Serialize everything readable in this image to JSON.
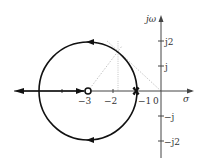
{
  "diagram": {
    "axes": {
      "imag_label": "jω",
      "real_label": "σ",
      "real_ticks": [
        "−3",
        "−2",
        "−1",
        "0"
      ],
      "imag_ticks": [
        "j2",
        "j",
        "−j",
        "−j2"
      ]
    },
    "markers": {
      "zero_label": "zero at −3",
      "pole_label": "double pole at −1"
    },
    "colors": {
      "locus": "#111111",
      "axis": "#444444",
      "guide": "#aaaaaa"
    }
  }
}
